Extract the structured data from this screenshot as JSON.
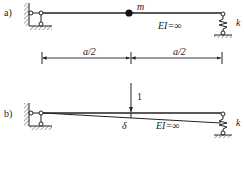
{
  "figure": {
    "part_a": {
      "label": "a)",
      "mass_label": "m",
      "stiffness_label": "EI=∞",
      "spring_label": "k",
      "colors": {
        "line": "#222222",
        "hatch": "#555555",
        "mass": "#111111"
      }
    },
    "dimensions": {
      "left_label": "a/2",
      "right_label": "a/2"
    },
    "part_b": {
      "label": "b)",
      "load_label": "1",
      "deflection_label": "δ",
      "stiffness_label": "EI=∞",
      "spring_label": "k"
    }
  }
}
